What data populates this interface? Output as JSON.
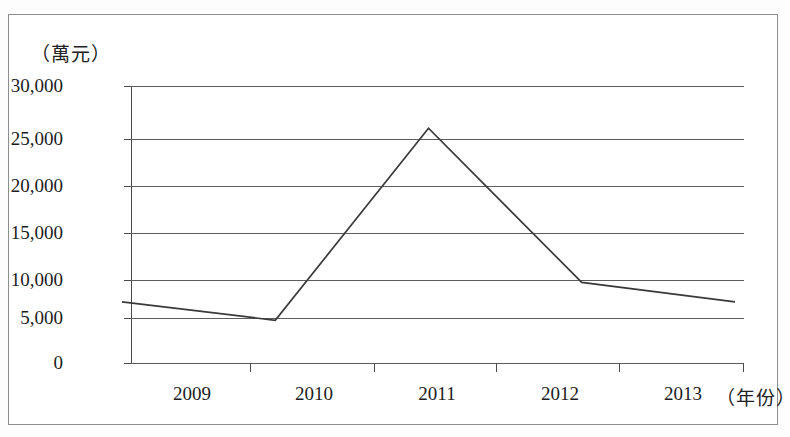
{
  "figure": {
    "y_axis_unit": "（萬元）",
    "x_axis_unit": "（年份）"
  },
  "chart_data": {
    "type": "line",
    "title": "",
    "subtitle": "",
    "xlabel": "（年份）",
    "ylabel": "（萬元）",
    "categories": [
      "2009",
      "2010",
      "2011",
      "2012",
      "2013"
    ],
    "x": [
      2009,
      2010,
      2011,
      2012,
      2013
    ],
    "values": [
      5000,
      3000,
      23800,
      7100,
      5000
    ],
    "series": [
      {
        "name": "",
        "values": [
          5000,
          3000,
          23800,
          7100,
          5000
        ]
      }
    ],
    "ylim": [
      0,
      30000
    ],
    "yticks": [
      0,
      5000,
      10000,
      15000,
      20000,
      25000,
      30000
    ],
    "ytick_labels": [
      "0",
      "5,000",
      "10,000",
      "15,000",
      "20,000",
      "25,000",
      "30,000"
    ],
    "xticks": [
      "2009",
      "2010",
      "2011",
      "2012",
      "2013"
    ],
    "grid": true,
    "grid_axis": "y",
    "legend": false,
    "legend_position": "none",
    "line_color": "#3a3a3a",
    "grid_color": "#5d5d5d",
    "axis_color": "#4a4a4a",
    "background_color": "#ffffff",
    "markers": false,
    "annotations": []
  }
}
